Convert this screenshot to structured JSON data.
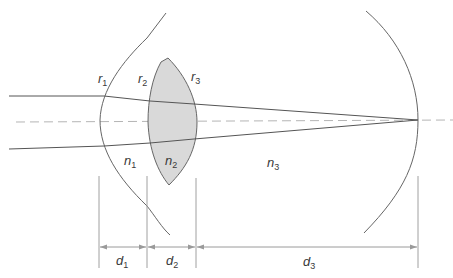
{
  "diagram": {
    "title": "",
    "type": "schematic eye optical model",
    "colors": {
      "line": "#555555",
      "axis": "#b0b0b0",
      "lens_fill": "#d9d9d9",
      "dimension": "#9a9a9a"
    },
    "surface_labels": [
      {
        "id": "r1",
        "base": "r",
        "sub": "1"
      },
      {
        "id": "r2",
        "base": "r",
        "sub": "2"
      },
      {
        "id": "r3",
        "base": "r",
        "sub": "3"
      }
    ],
    "medium_labels": [
      {
        "id": "n1",
        "base": "n",
        "sub": "1"
      },
      {
        "id": "n2",
        "base": "n",
        "sub": "2"
      },
      {
        "id": "n3",
        "base": "n",
        "sub": "3"
      }
    ],
    "distance_labels": [
      {
        "id": "d1",
        "base": "d",
        "sub": "1"
      },
      {
        "id": "d2",
        "base": "d",
        "sub": "2"
      },
      {
        "id": "d3",
        "base": "d",
        "sub": "3"
      }
    ]
  }
}
